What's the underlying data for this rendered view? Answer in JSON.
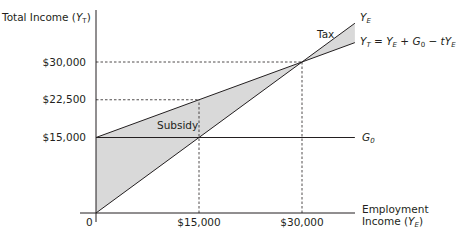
{
  "chart_data": {
    "type": "line",
    "title": "",
    "xlabel": "Employment Income (Y_E)",
    "ylabel": "Total Income (Y_T)",
    "xlim": [
      0,
      37700
    ],
    "ylim": [
      0,
      38700
    ],
    "grid": false,
    "x_ticks": [
      {
        "value": 0,
        "label": "0"
      },
      {
        "value": 15000,
        "label": "$15,000"
      },
      {
        "value": 30000,
        "label": "$30,000"
      }
    ],
    "y_ticks": [
      {
        "value": 15000,
        "label": "$15,000"
      },
      {
        "value": 22500,
        "label": "$22,500"
      },
      {
        "value": 30000,
        "label": "$30,000"
      }
    ],
    "series": [
      {
        "name": "Y_E",
        "label": "Y_E",
        "x": [
          0,
          37700
        ],
        "y": [
          0,
          37700
        ]
      },
      {
        "name": "Y_T = Y_E + G_0 - tY_E",
        "label": "Y_T = Y_E + G_0 − tY_E",
        "x": [
          0,
          15000,
          30000,
          37700
        ],
        "y": [
          15000,
          22500,
          30000,
          33850
        ]
      },
      {
        "name": "G_0",
        "label": "G_0",
        "x": [
          0,
          37700
        ],
        "y": [
          15000,
          15000
        ]
      }
    ],
    "shaded_regions": [
      {
        "label": "Subsidy",
        "between": [
          "Y_T",
          "Y_E"
        ],
        "x_range": [
          0,
          30000
        ]
      },
      {
        "label": "Tax",
        "between": [
          "Y_E",
          "Y_T"
        ],
        "x_range": [
          30000,
          37700
        ]
      }
    ],
    "reference_lines": [
      {
        "type": "dashed",
        "from": [
          0,
          30000
        ],
        "to": [
          30000,
          30000
        ]
      },
      {
        "type": "dashed",
        "from": [
          0,
          22500
        ],
        "to": [
          15000,
          22500
        ]
      },
      {
        "type": "dashed",
        "from": [
          15000,
          0
        ],
        "to": [
          15000,
          22500
        ]
      },
      {
        "type": "dashed",
        "from": [
          30000,
          0
        ],
        "to": [
          30000,
          30000
        ]
      }
    ],
    "annotations": [
      "Tax",
      "Subsidy"
    ]
  },
  "labels": {
    "y_axis_title": "Total Income (",
    "y_axis_var": "Y",
    "y_axis_sub": "T",
    "y_axis_close": ")",
    "x_axis_line1": "Employment",
    "x_axis_line2": "Income (",
    "x_axis_var": "Y",
    "x_axis_sub": "E",
    "x_axis_close": ")",
    "ye_var": "Y",
    "ye_sub": "E",
    "yt_eq": "Y",
    "yt_sub": "T",
    "yt_rest": " = Y",
    "yt_rest_sub": "E",
    "yt_plus": " + G",
    "yt_plus_sub": "0",
    "yt_minus": " − tY",
    "yt_minus_sub": "E",
    "g0_var": "G",
    "g0_sub": "0",
    "tax": "Tax",
    "subsidy": "Subsidy"
  },
  "colors": {
    "line": "#231f20",
    "fill": "#d9d9d9",
    "background": "#ffffff"
  }
}
